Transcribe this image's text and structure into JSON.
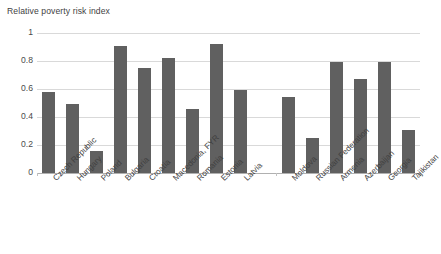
{
  "chart_data": {
    "type": "bar",
    "title": "Relative poverty risk index",
    "xlabel": "",
    "ylabel": "",
    "ylim": [
      0,
      1
    ],
    "yticks": [
      "0",
      "0.2",
      "0.4",
      "0.6",
      "0.8",
      "1"
    ],
    "ytick_values": [
      0,
      0.2,
      0.4,
      0.6,
      0.8,
      1
    ],
    "grid": true,
    "legend": "none",
    "bar_color": "#606060",
    "gridline_color": "#d9d9d9",
    "categories": [
      "Czech Republic",
      "Hungary",
      "Poland",
      "Bulgaria",
      "Croatia",
      "Macedonia, FYR",
      "Romania",
      "Estonia",
      "Latvia",
      "",
      "Moldova",
      "Russian Federation",
      "Armenia",
      "Azerbaijan",
      "Georgia",
      "Tajikistan"
    ],
    "values": [
      0.58,
      0.49,
      0.16,
      0.91,
      0.75,
      0.82,
      0.46,
      0.92,
      0.59,
      null,
      0.545,
      0.25,
      0.79,
      0.67,
      0.795,
      0.31
    ]
  }
}
